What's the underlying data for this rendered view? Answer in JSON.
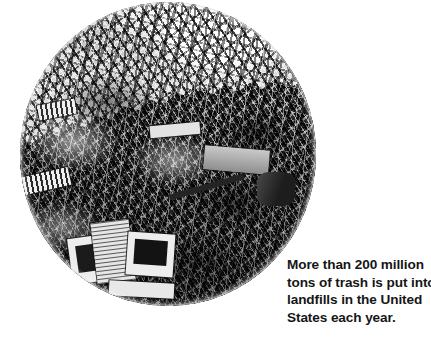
{
  "page": {
    "background_color": "#ffffff",
    "width": 431,
    "height": 354
  },
  "photo": {
    "name": "landfill-photograph",
    "shape": "ellipse",
    "palette": "black-and-white",
    "subject": "mountain of trash in a landfill with discarded computer monitors, keyboards and appliances in the foreground and cloudy sky above",
    "alt_text": "Black and white oval photograph of an enormous heap of garbage at a landfill"
  },
  "caption": {
    "text_color": "#161616",
    "lines": [
      "More than 200 million",
      "tons of trash is put into",
      "landfills in the United",
      "States each year."
    ],
    "full_text": "More than 200 million tons of trash is put into landfills in the United States each year."
  }
}
